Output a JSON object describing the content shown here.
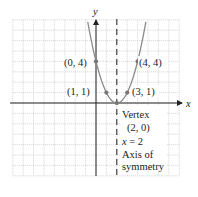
{
  "chart_data": {
    "type": "line",
    "title": "",
    "equation": "y = (x - 2)^2",
    "xlabel": "x",
    "ylabel": "y",
    "grid": true,
    "xlim": [
      -8,
      8
    ],
    "ylim": [
      -7,
      8
    ],
    "curve": {
      "name": "parabola",
      "color": "#8a8a8a"
    },
    "points": [
      {
        "x": 0,
        "y": 4,
        "label": "(0, 4)"
      },
      {
        "x": 4,
        "y": 4,
        "label": "(4, 4)"
      },
      {
        "x": 1,
        "y": 1,
        "label": "(1, 1)"
      },
      {
        "x": 3,
        "y": 1,
        "label": "(3, 1)"
      },
      {
        "x": 2,
        "y": 0,
        "label": "(2, 0)"
      }
    ],
    "annotations": {
      "vertex_title": "Vertex",
      "vertex_coords": "(2, 0)",
      "axis_eq_var": "x",
      "axis_eq_rest": " = 2",
      "axis_line1": "Axis of",
      "axis_line2": "symmetry"
    },
    "axis_of_symmetry": {
      "x": 2,
      "style": "dashed"
    }
  },
  "labels": {
    "x_axis": "x",
    "y_axis": "y",
    "p04": "(0, 4)",
    "p44": "(4, 4)",
    "p11": "(1, 1)",
    "p31": "(3, 1)"
  },
  "colors": {
    "grid": "#b8b8b8",
    "axis": "#222222",
    "curve": "#8a8a8a",
    "point": "#777777"
  }
}
